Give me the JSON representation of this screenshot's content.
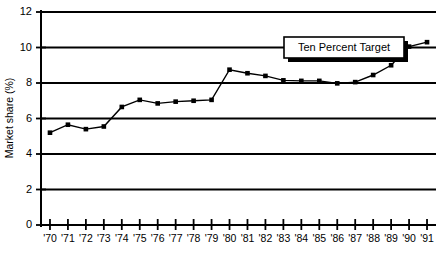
{
  "chart_data": {
    "type": "line",
    "title": "",
    "xlabel": "",
    "ylabel": "Market share (%)",
    "categories": [
      "'70",
      "'71",
      "'72",
      "'73",
      "'74",
      "'75",
      "'76",
      "'77",
      "'78",
      "'79",
      "'80",
      "'81",
      "'82",
      "'83",
      "'84",
      "'85",
      "'86",
      "'87",
      "'88",
      "'89",
      "'90",
      "'91"
    ],
    "values": [
      5.2,
      5.65,
      5.4,
      5.55,
      6.65,
      7.05,
      6.85,
      6.95,
      7.0,
      7.05,
      8.75,
      8.55,
      8.4,
      8.15,
      8.12,
      8.12,
      7.98,
      8.05,
      8.45,
      9.0,
      10.05,
      10.3
    ],
    "series": [
      {
        "name": "Market share",
        "values": [
          5.2,
          5.65,
          5.4,
          5.55,
          6.65,
          7.05,
          6.85,
          6.95,
          7.0,
          7.05,
          8.75,
          8.55,
          8.4,
          8.15,
          8.12,
          8.12,
          7.98,
          8.05,
          8.45,
          9.0,
          10.05,
          10.3
        ]
      }
    ],
    "ylim": [
      0,
      12
    ],
    "yticks": [
      0,
      2,
      4,
      6,
      8,
      10,
      12
    ],
    "ytick_labels": [
      "0",
      "2",
      "4",
      "6",
      "8",
      "10",
      "12"
    ],
    "grid": true,
    "grid_axis": "y",
    "legend": false,
    "marker": "square",
    "line_color": "#000000",
    "marker_color": "#000000",
    "grid_color": "#000000",
    "background_color": "#ffffff",
    "annotations": [
      {
        "text": "Ten Percent Target",
        "value": 10,
        "box": true,
        "box_fill": "#ffffff",
        "box_border": "#000000",
        "shadow": true
      }
    ]
  }
}
